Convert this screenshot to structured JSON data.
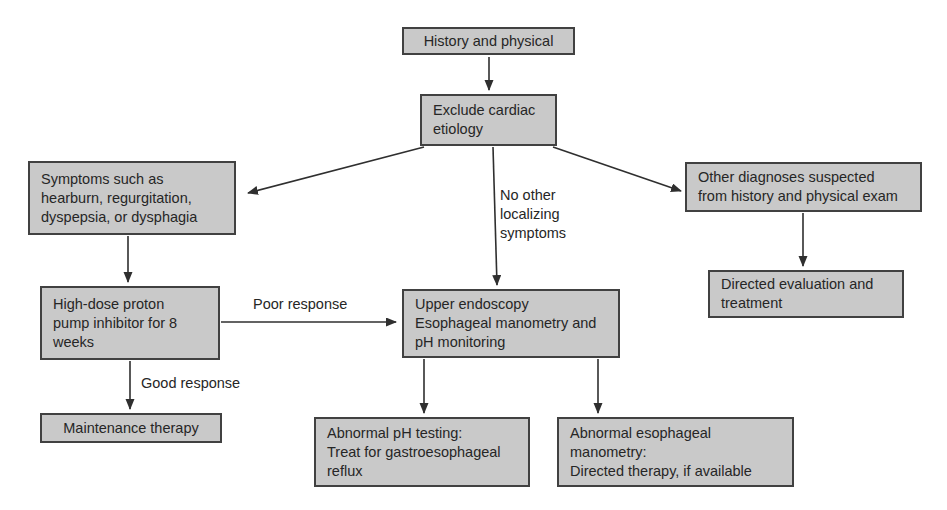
{
  "figure": {
    "type": "flowchart",
    "background": "#ffffff",
    "box_fill": "#c9c9c9",
    "box_border": "#414141",
    "text_color": "#262626",
    "arrow_color": "#2f2f2f"
  },
  "nodes": {
    "history_physical": {
      "text": "History and physical"
    },
    "exclude_cardiac": {
      "text": "Exclude cardiac\netiology"
    },
    "symptoms": {
      "text": "Symptoms such as\nhearburn, regurgitation,\ndyspepsia, or dysphagia"
    },
    "other_diagnoses": {
      "text": "Other diagnoses suspected\nfrom history and physical exam"
    },
    "directed_evaluation": {
      "text": "Directed evaluation and\ntreatment"
    },
    "ppi_trial": {
      "text": "High-dose proton\npump inhibitor for 8\nweeks"
    },
    "endoscopy_manometry": {
      "text": "Upper endoscopy\nEsophageal manometry and\npH monitoring"
    },
    "maintenance_therapy": {
      "text": "Maintenance therapy"
    },
    "abnormal_ph": {
      "text": "Abnormal pH testing:\nTreat for gastroesophageal\nreflux"
    },
    "abnormal_manometry": {
      "text": "Abnormal esophageal\nmanometry:\nDirected therapy, if available"
    }
  },
  "edge_labels": {
    "no_other_localizing": "No other\nlocalizing\nsymptoms",
    "poor_response": "Poor response",
    "good_response": "Good response"
  }
}
